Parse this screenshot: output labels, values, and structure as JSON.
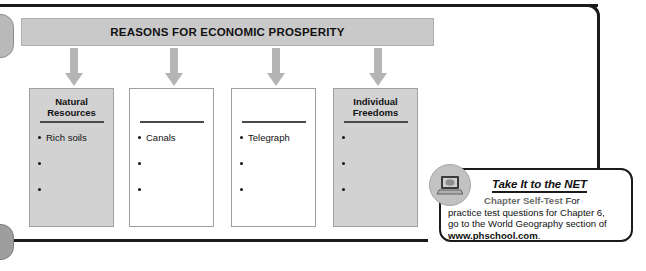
{
  "page": {
    "rules": {
      "top_rule": "horizontal-rule",
      "bottom_rule": "horizontal-rule",
      "right_vertical_rule": "vertical-rule"
    }
  },
  "banner": {
    "title": "REASONS FOR ECONOMIC PROSPERITY",
    "fill": "#c9c9c9"
  },
  "arrows": [
    {
      "name": "arrow-to-column-1"
    },
    {
      "name": "arrow-to-column-2"
    },
    {
      "name": "arrow-to-column-3"
    },
    {
      "name": "arrow-to-column-4"
    }
  ],
  "columns": [
    {
      "id": "natural-resources",
      "title": "Natural\nResources",
      "title_line1": "Natural",
      "title_line2": "Resources",
      "shaded": true,
      "items": [
        "Rich soils",
        "",
        ""
      ]
    },
    {
      "id": "column-2",
      "title": "",
      "title_line1": "",
      "title_line2": "",
      "shaded": false,
      "items": [
        "Canals",
        "",
        ""
      ]
    },
    {
      "id": "column-3",
      "title": "",
      "title_line1": "",
      "title_line2": "",
      "shaded": false,
      "items": [
        "Telegraph",
        "",
        ""
      ]
    },
    {
      "id": "individual-freedoms",
      "title": "Individual\nFreedoms",
      "title_line1": "Individual",
      "title_line2": "Freedoms",
      "shaded": true,
      "items": [
        "",
        "",
        ""
      ]
    }
  ],
  "net_callout": {
    "icon": "computer-icon",
    "heading": "Take It to the NET",
    "subhead": "Chapter Self-Test",
    "body_line1": "For",
    "body_line2": "practice test questions for Chapter 6,",
    "body_line3": "go to the World Geography section of",
    "url": "www.phschool.com",
    "period": "."
  }
}
